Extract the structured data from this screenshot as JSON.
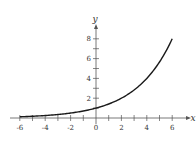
{
  "chart_data": {
    "type": "line",
    "title": "",
    "xlabel": "x",
    "ylabel": "y",
    "xlim": [
      -6.5,
      7.5
    ],
    "ylim": [
      -1,
      9
    ],
    "x_ticks": [
      -6,
      -5,
      -4,
      -3,
      -2,
      -1,
      0,
      1,
      2,
      3,
      4,
      5,
      6
    ],
    "x_tick_labels": [
      "-6",
      "-4",
      "-2",
      "0",
      "2",
      "4",
      "6"
    ],
    "x_tick_label_values": [
      -6,
      -4,
      -2,
      0,
      2,
      4,
      6
    ],
    "y_ticks": [
      1,
      2,
      3,
      4,
      5,
      6,
      7,
      8
    ],
    "y_tick_labels": [
      "2",
      "4",
      "6",
      "8"
    ],
    "y_tick_label_values": [
      2,
      4,
      6,
      8
    ],
    "grid": false,
    "series": [
      {
        "name": "exponential curve",
        "function": "y = 2^(x/2)",
        "x": [
          -6,
          -5,
          -4,
          -3,
          -2,
          -1,
          0,
          1,
          2,
          3,
          4,
          5,
          6
        ],
        "values": [
          0.13,
          0.18,
          0.25,
          0.35,
          0.5,
          0.71,
          1,
          1.41,
          2,
          2.83,
          4,
          5.66,
          8
        ]
      }
    ]
  },
  "colors": {
    "axis": "#555555",
    "curve": "#1a1a1a",
    "text": "#333333"
  }
}
